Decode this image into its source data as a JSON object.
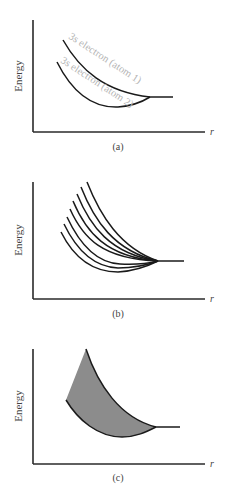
{
  "panels": [
    {
      "id": "a",
      "caption": "(a)",
      "ylabel": "Energy",
      "xlabel": "r",
      "curve_labels": [
        "3s electron (atom 1)",
        "3s electron (atom 2)"
      ]
    },
    {
      "id": "b",
      "caption": "(b)",
      "ylabel": "Energy",
      "xlabel": "r"
    },
    {
      "id": "c",
      "caption": "(c)",
      "ylabel": "Energy",
      "xlabel": "r"
    }
  ],
  "colors": {
    "axis": "#2a2a2a",
    "curve": "#1a1a1a",
    "curve_label": "#b4b4b4",
    "band_fill": "#8c8c8c"
  }
}
